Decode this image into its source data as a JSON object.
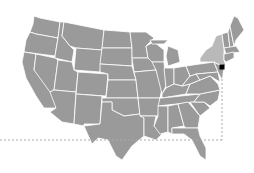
{
  "map": {
    "region": "United States (contiguous)",
    "base_color": "#9a9a9a",
    "border_color": "#ffffff",
    "highlight": {
      "state": "New York",
      "color": "#b9b9b9"
    },
    "marker": {
      "label": "New York City",
      "x": 222,
      "y": 67,
      "color": "#000000",
      "shape": "square"
    },
    "guides": {
      "horizontal": {
        "y": 140,
        "x_from": 0,
        "x_to": 222,
        "style": "dashed",
        "color": "#aaaaaa"
      },
      "vertical": {
        "x": 222,
        "y_from": 67,
        "y_to": 140,
        "style": "dashed",
        "color": "#aaaaaa"
      }
    }
  }
}
